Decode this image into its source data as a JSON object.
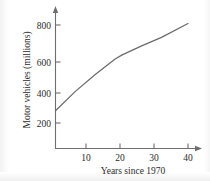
{
  "chart_data": {
    "type": "line",
    "title": "",
    "xlabel": "Years since 1970",
    "ylabel": "Motor vehicles (millions)",
    "xlim": [
      0,
      44
    ],
    "ylim": [
      0,
      880
    ],
    "grid": false,
    "legend": "none",
    "xticks": [
      10,
      20,
      30,
      40
    ],
    "xtick_labels": [
      "10",
      "20",
      "30",
      "40"
    ],
    "yticks": [
      200,
      400,
      600,
      800
    ],
    "ytick_labels": [
      "200",
      "400",
      "600",
      "800"
    ],
    "series": [
      {
        "name": "Motor vehicles",
        "x": [
          0,
          6,
          12,
          18,
          20,
          26,
          32,
          40
        ],
        "values": [
          245,
          370,
          480,
          580,
          605,
          665,
          720,
          810
        ]
      }
    ],
    "line_color": "#6b6b6b",
    "axis_color": "#6e6e6e",
    "annotations": []
  },
  "figure": {
    "y_axis_name": "y-axis",
    "x_axis_name": "x-axis"
  }
}
